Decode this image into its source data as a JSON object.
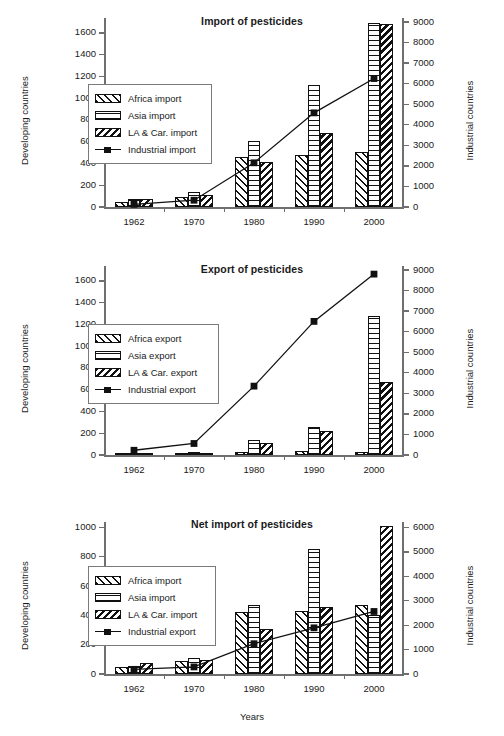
{
  "figure": {
    "xaxis_title": "Years",
    "categories": [
      "1962",
      "1970",
      "1980",
      "1990",
      "2000"
    ]
  },
  "chart_data": [
    {
      "type": "bar",
      "title": "Import of pesticides",
      "xlabel": "",
      "ylabel": "Developing countries",
      "y2label": "Industrial countries",
      "categories": [
        "1962",
        "1970",
        "1980",
        "1990",
        "2000"
      ],
      "ylim": [
        0,
        1700
      ],
      "yticks": [
        0,
        200,
        400,
        600,
        800,
        1000,
        1200,
        1400,
        1600
      ],
      "y2lim": [
        0,
        9000
      ],
      "y2ticks": [
        0,
        1000,
        2000,
        3000,
        4000,
        5000,
        6000,
        7000,
        8000,
        9000
      ],
      "grid": false,
      "legend_position": "upper left",
      "series": [
        {
          "name": "Africa import",
          "kind": "bar",
          "axis": "left",
          "pattern": "forward-hatch",
          "values": [
            50,
            90,
            455,
            475,
            510
          ]
        },
        {
          "name": "Asia import",
          "kind": "bar",
          "axis": "left",
          "pattern": "horizontal-lines",
          "values": [
            70,
            140,
            605,
            1120,
            1690
          ]
        },
        {
          "name": "LA & Car. import",
          "kind": "bar",
          "axis": "left",
          "pattern": "back-hatch",
          "values": [
            70,
            110,
            410,
            680,
            1680
          ]
        },
        {
          "name": "Industrial import",
          "kind": "line",
          "axis": "right",
          "pattern": "line-square",
          "values": [
            130,
            330,
            2150,
            4580,
            6250
          ]
        }
      ]
    },
    {
      "type": "bar",
      "title": "Export of pesticides",
      "xlabel": "",
      "ylabel": "Developing countries",
      "y2label": "Industrial countries",
      "categories": [
        "1962",
        "1970",
        "1980",
        "1990",
        "2000"
      ],
      "ylim": [
        0,
        1700
      ],
      "yticks": [
        0,
        200,
        400,
        600,
        800,
        1000,
        1200,
        1400,
        1600
      ],
      "y2lim": [
        0,
        9000
      ],
      "y2ticks": [
        0,
        1000,
        2000,
        3000,
        4000,
        5000,
        6000,
        7000,
        8000,
        9000
      ],
      "grid": false,
      "legend_position": "upper left",
      "series": [
        {
          "name": "Africa export",
          "kind": "bar",
          "axis": "left",
          "pattern": "forward-hatch",
          "values": [
            20,
            8,
            28,
            35,
            30
          ]
        },
        {
          "name": "Asia export",
          "kind": "bar",
          "axis": "left",
          "pattern": "horizontal-lines",
          "values": [
            8,
            30,
            140,
            260,
            1280
          ]
        },
        {
          "name": "LA & Car.  export",
          "kind": "bar",
          "axis": "left",
          "pattern": "back-hatch",
          "values": [
            5,
            10,
            110,
            220,
            670
          ]
        },
        {
          "name": "Industrial export",
          "kind": "line",
          "axis": "right",
          "pattern": "line-square",
          "values": [
            230,
            560,
            3350,
            6500,
            8800
          ]
        }
      ]
    },
    {
      "type": "bar",
      "title": "Net import of pesticides",
      "xlabel": "Years",
      "ylabel": "Developing countries",
      "y2label": "Industrial countries",
      "categories": [
        "1962",
        "1970",
        "1980",
        "1990",
        "2000"
      ],
      "ylim": [
        0,
        1010
      ],
      "yticks": [
        0,
        200,
        400,
        600,
        800,
        1000
      ],
      "y2lim": [
        0,
        6060
      ],
      "y2ticks": [
        0,
        1000,
        2000,
        3000,
        4000,
        5000,
        6000
      ],
      "grid": false,
      "legend_position": "upper left",
      "series": [
        {
          "name": "Africa import",
          "kind": "bar",
          "axis": "left",
          "pattern": "forward-hatch",
          "values": [
            45,
            90,
            425,
            430,
            470
          ]
        },
        {
          "name": "Asia import",
          "kind": "bar",
          "axis": "left",
          "pattern": "horizontal-lines",
          "values": [
            55,
            110,
            470,
            855,
            405
          ]
        },
        {
          "name": "LA & Car. import",
          "kind": "bar",
          "axis": "left",
          "pattern": "back-hatch",
          "values": [
            75,
            95,
            310,
            460,
            1010
          ]
        },
        {
          "name": "Industrial export",
          "kind": "line",
          "axis": "right",
          "pattern": "line-square",
          "values": [
            190,
            290,
            1240,
            1890,
            2560
          ]
        }
      ]
    }
  ]
}
